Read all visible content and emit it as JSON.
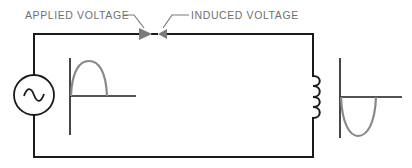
{
  "diagram": {
    "labels": {
      "applied_voltage": "APPLIED VOLTAGE",
      "induced_voltage": "INDUCED VOLTAGE"
    },
    "components": {
      "source": "ac-voltage-source",
      "load": "inductor-coil"
    },
    "waveforms": {
      "applied": "positive half-cycle",
      "induced": "negative half-cycle"
    },
    "colors": {
      "wire": "#1a1a1a",
      "waveform": "#888888",
      "arrow": "#7a7a7a",
      "label": "#6f6f6f"
    }
  }
}
